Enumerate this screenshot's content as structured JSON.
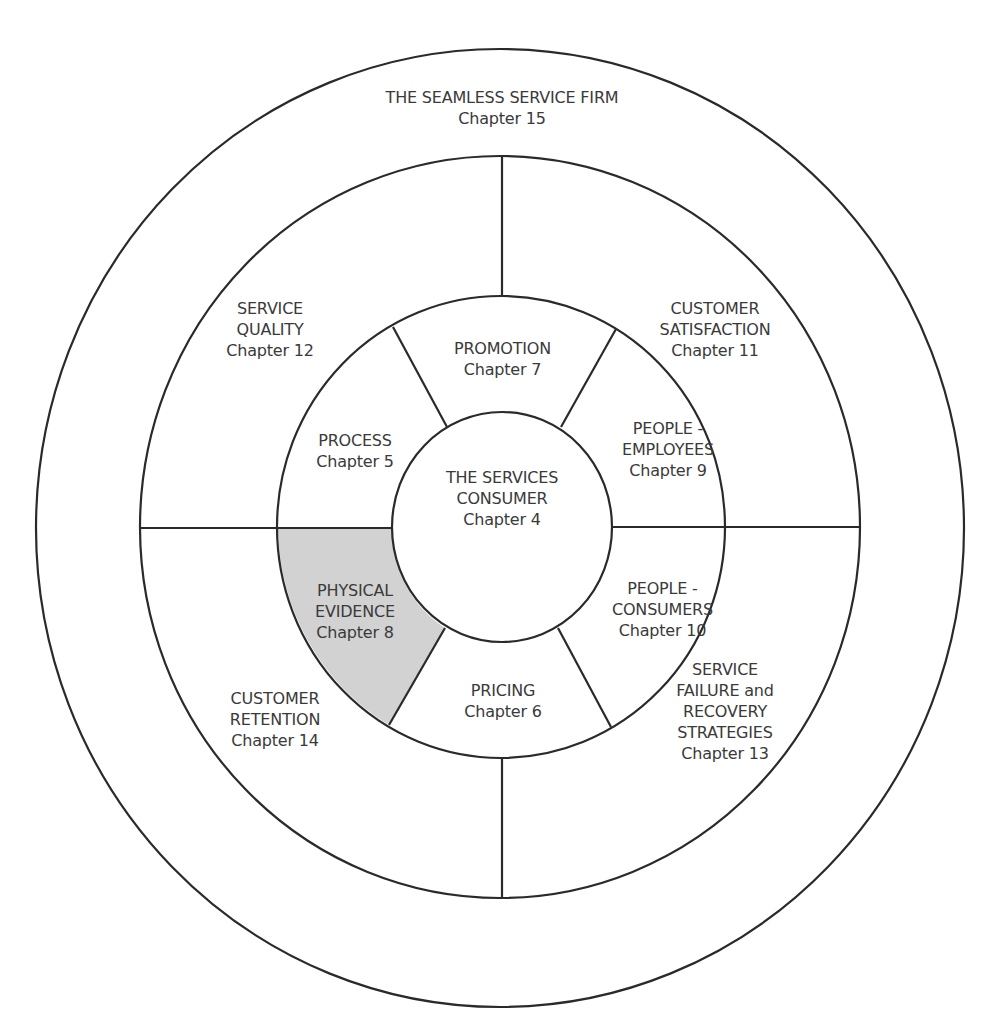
{
  "diagram": {
    "outer": {
      "title": "THE SEAMLESS SERVICE FIRM",
      "chapter": "Chapter 15"
    },
    "center": {
      "lines": [
        "THE SERVICES",
        "CONSUMER"
      ],
      "chapter": "Chapter 4"
    },
    "middle_ring": [
      {
        "id": "promotion",
        "lines": [
          "PROMOTION"
        ],
        "chapter": "Chapter 7"
      },
      {
        "id": "people-employees",
        "lines": [
          "PEOPLE -",
          "EMPLOYEES"
        ],
        "chapter": "Chapter 9"
      },
      {
        "id": "people-consumers",
        "lines": [
          "PEOPLE -",
          "CONSUMERS"
        ],
        "chapter": "Chapter 10"
      },
      {
        "id": "pricing",
        "lines": [
          "PRICING"
        ],
        "chapter": "Chapter 6"
      },
      {
        "id": "physical-evidence",
        "lines": [
          "PHYSICAL",
          "EVIDENCE"
        ],
        "chapter": "Chapter 8",
        "highlighted": true
      },
      {
        "id": "process",
        "lines": [
          "PROCESS"
        ],
        "chapter": "Chapter 5"
      }
    ],
    "outer_ring": [
      {
        "id": "service-quality",
        "lines": [
          "SERVICE",
          "QUALITY"
        ],
        "chapter": "Chapter 12"
      },
      {
        "id": "customer-satisfaction",
        "lines": [
          "CUSTOMER",
          "SATISFACTION"
        ],
        "chapter": "Chapter 11"
      },
      {
        "id": "service-failure",
        "lines": [
          "SERVICE",
          "FAILURE and",
          "RECOVERY",
          "STRATEGIES"
        ],
        "chapter": "Chapter 13"
      },
      {
        "id": "customer-retention",
        "lines": [
          "CUSTOMER",
          "RETENTION"
        ],
        "chapter": "Chapter 14"
      }
    ],
    "colors": {
      "line": "#2a2a2a",
      "highlight": "#d2d2d2",
      "text": "#3a3a3a"
    }
  }
}
